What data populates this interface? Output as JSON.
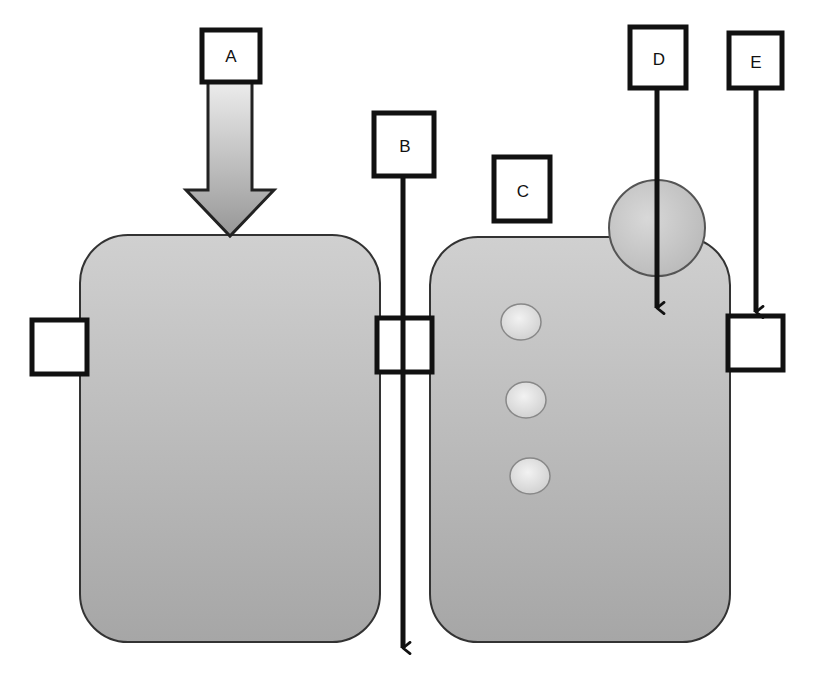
{
  "diagram": {
    "labels": {
      "a": "A",
      "b": "B",
      "c": "C",
      "d": "D",
      "e": "E"
    },
    "colors": {
      "stroke": "#111111",
      "body_fill_top": "#cfcfcf",
      "body_fill_bottom": "#a9a9a9",
      "arrow_fill_top": "#e6e6e6",
      "arrow_fill_bottom": "#9a9a9a",
      "dot_fill": "#e4e4e4",
      "circle_fill": "#c8c8c8"
    },
    "left_block": {
      "side_ports": 2
    },
    "right_block": {
      "dots": 3,
      "side_ports": 1,
      "top_circle": 1
    }
  }
}
